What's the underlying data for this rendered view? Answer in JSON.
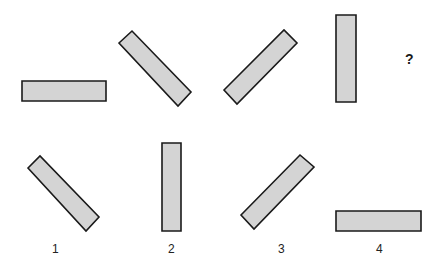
{
  "puzzle": {
    "sequence": [
      {
        "id": "seq-1",
        "orientation": "horizontal",
        "points": "22,81 106,81 106,101 22,101"
      },
      {
        "id": "seq-2",
        "orientation": "diagonal-down-right",
        "points": "119,43 132,31 191,92 178,106"
      },
      {
        "id": "seq-3",
        "orientation": "diagonal-up-right",
        "points": "224,90 284,30 297,43 237,104"
      },
      {
        "id": "seq-4",
        "orientation": "vertical",
        "points": "336,15 356,15 356,102 336,102"
      }
    ],
    "question_mark": "?",
    "options": [
      {
        "label": "1",
        "orientation": "diagonal-down-right",
        "points": "28,168 40,156 99,217 86,231"
      },
      {
        "label": "2",
        "orientation": "vertical",
        "points": "162,143 181,143 181,231 162,231"
      },
      {
        "label": "3",
        "orientation": "diagonal-up-right",
        "points": "241,215 300,155 314,167 254,229"
      },
      {
        "label": "4",
        "orientation": "horizontal",
        "points": "336,211 421,211 421,231 336,231"
      }
    ]
  },
  "colors": {
    "fill": "#d4d4d4",
    "stroke": "#1a1a1a",
    "background": "#ffffff"
  }
}
